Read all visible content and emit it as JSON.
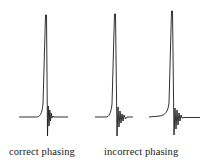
{
  "figure": {
    "labels": {
      "correct": "correct phasing",
      "incorrect": "incorrect phasing"
    },
    "line_color": "#1a1a1a",
    "background": "#ffffff"
  },
  "spectra": [
    {
      "name": "correct-phasing-spectrum",
      "baseline_y": 117,
      "x_start": 19,
      "x_end": 68,
      "peak_x": 46,
      "peak_top_y": 15,
      "ringing_min_y": 136,
      "phasing": "correct"
    },
    {
      "name": "incorrect-phasing-spectrum-1",
      "baseline_y": 117,
      "x_start": 95,
      "x_end": 133,
      "peak_x": 115,
      "peak_top_y": 14,
      "ringing_min_y": 136,
      "phasing": "incorrect"
    },
    {
      "name": "incorrect-phasing-spectrum-2",
      "baseline_y": 117,
      "x_start": 149,
      "x_end": 200,
      "peak_x": 172,
      "peak_top_y": 11,
      "ringing_min_y": 136,
      "phasing": "incorrect"
    }
  ]
}
